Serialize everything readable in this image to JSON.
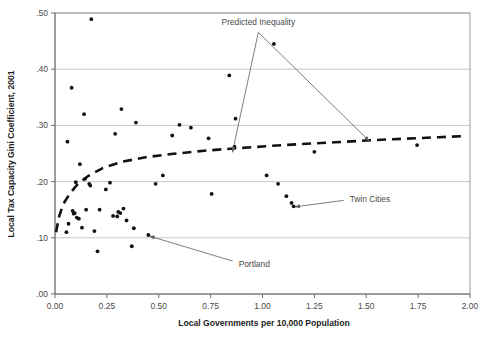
{
  "chart_data": {
    "type": "scatter",
    "title": "",
    "xlabel": "Local Governments per 10,000 Population",
    "ylabel": "Local Tax Capacity Gini Coefficient, 2001",
    "xlim": [
      0.0,
      2.0
    ],
    "ylim": [
      0.0,
      0.5
    ],
    "xticks": [
      0.0,
      0.25,
      0.5,
      0.75,
      1.0,
      1.25,
      1.5,
      1.75,
      2.0
    ],
    "xtick_labels": [
      "0.00",
      "0.25",
      "0.50",
      "0.75",
      "1.00",
      "1.25",
      "1.50",
      "1.75",
      "2.00"
    ],
    "yticks": [
      0.0,
      0.1,
      0.2,
      0.3,
      0.4,
      0.5
    ],
    "ytick_labels": [
      ".00",
      ".10",
      ".20",
      ".30",
      ".40",
      ".50"
    ],
    "grid": "horizontal",
    "legend_position": "none",
    "series": [
      {
        "name": "Metropolitan areas",
        "type": "scatter",
        "marker": "filled-circle",
        "color": "#111111",
        "points": [
          [
            0.055,
            0.11
          ],
          [
            0.06,
            0.271
          ],
          [
            0.065,
            0.125
          ],
          [
            0.08,
            0.367
          ],
          [
            0.085,
            0.148
          ],
          [
            0.09,
            0.143
          ],
          [
            0.095,
            0.144
          ],
          [
            0.1,
            0.199
          ],
          [
            0.105,
            0.136
          ],
          [
            0.115,
            0.134
          ],
          [
            0.12,
            0.231
          ],
          [
            0.13,
            0.118
          ],
          [
            0.14,
            0.32
          ],
          [
            0.145,
            0.205
          ],
          [
            0.15,
            0.15
          ],
          [
            0.165,
            0.196
          ],
          [
            0.17,
            0.193
          ],
          [
            0.175,
            0.489
          ],
          [
            0.19,
            0.112
          ],
          [
            0.205,
            0.076
          ],
          [
            0.215,
            0.15
          ],
          [
            0.245,
            0.186
          ],
          [
            0.265,
            0.198
          ],
          [
            0.28,
            0.139
          ],
          [
            0.29,
            0.285
          ],
          [
            0.3,
            0.138
          ],
          [
            0.305,
            0.146
          ],
          [
            0.315,
            0.144
          ],
          [
            0.32,
            0.329
          ],
          [
            0.33,
            0.152
          ],
          [
            0.345,
            0.131
          ],
          [
            0.37,
            0.085
          ],
          [
            0.38,
            0.117
          ],
          [
            0.39,
            0.305
          ],
          [
            0.45,
            0.105
          ],
          [
            0.485,
            0.196
          ],
          [
            0.52,
            0.211
          ],
          [
            0.565,
            0.282
          ],
          [
            0.6,
            0.301
          ],
          [
            0.655,
            0.296
          ],
          [
            0.74,
            0.277
          ],
          [
            0.755,
            0.178
          ],
          [
            0.84,
            0.389
          ],
          [
            0.865,
            0.262
          ],
          [
            0.87,
            0.312
          ],
          [
            1.02,
            0.211
          ],
          [
            1.055,
            0.445
          ],
          [
            1.075,
            0.196
          ],
          [
            1.115,
            0.174
          ],
          [
            1.14,
            0.162
          ],
          [
            1.15,
            0.156
          ],
          [
            1.25,
            0.253
          ],
          [
            1.745,
            0.265
          ]
        ]
      },
      {
        "name": "Predicted Inequality",
        "type": "line",
        "style": "dashed",
        "color": "#121212",
        "points": [
          [
            0.005,
            0.11
          ],
          [
            0.02,
            0.138
          ],
          [
            0.04,
            0.16
          ],
          [
            0.07,
            0.178
          ],
          [
            0.11,
            0.196
          ],
          [
            0.16,
            0.21
          ],
          [
            0.23,
            0.224
          ],
          [
            0.32,
            0.235
          ],
          [
            0.43,
            0.243
          ],
          [
            0.56,
            0.249
          ],
          [
            0.72,
            0.255
          ],
          [
            0.9,
            0.26
          ],
          [
            1.1,
            0.265
          ],
          [
            1.35,
            0.27
          ],
          [
            1.6,
            0.275
          ],
          [
            1.85,
            0.279
          ],
          [
            1.98,
            0.281
          ]
        ]
      }
    ],
    "annotations": [
      {
        "text": "Predicted Inequality",
        "label_x": 0.98,
        "label_y": 0.478,
        "targets": [
          {
            "x": 0.855,
            "y": 0.252
          },
          {
            "x": 1.515,
            "y": 0.272
          }
        ]
      },
      {
        "text": "Twin Cities",
        "label_x": 1.42,
        "label_y": 0.163,
        "targets": [
          {
            "x": 1.155,
            "y": 0.155
          }
        ]
      },
      {
        "text": "Portland",
        "label_x": 0.885,
        "label_y": 0.048,
        "targets": [
          {
            "x": 0.455,
            "y": 0.103
          }
        ]
      }
    ]
  }
}
